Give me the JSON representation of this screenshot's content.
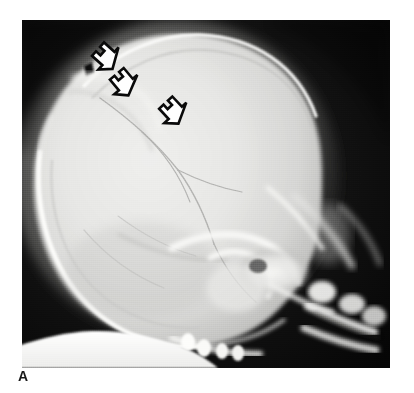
{
  "figure": {
    "label": "A",
    "modality": "radiograph",
    "view": "lateral skull",
    "background_color": "#ffffff"
  },
  "plate": {
    "x": 22,
    "y": 20,
    "width": 368,
    "height": 348,
    "film_background_color": "#0d0d0d",
    "corner_shadow_color": "#000000"
  },
  "anatomy": {
    "cranial_vault": {
      "name": "cranial-vault",
      "fill_color": "#e4e4e2",
      "description": "large lucent calvarium occupying left two-thirds of film"
    },
    "inner_table_line": {
      "name": "inner-table",
      "stroke_color": "#bdbdbb"
    },
    "outer_cortical_rim": {
      "name": "outer-cortical-rim",
      "stroke_color": "#fdfdfd",
      "description": "bright thin cortical line along vertex and occiput"
    },
    "scalp_soft_tissue": {
      "name": "scalp-soft-tissue",
      "fill_color": "#7a7a78"
    },
    "vascular_markings": {
      "name": "vascular-groove-markings",
      "stroke_color": "#9e9e9c",
      "count": 5
    },
    "lucent_band": {
      "name": "lucent-fracture-band",
      "stroke_color": "#f2f2f0",
      "description": "bright linear lucency under vertex indicated by arrows"
    },
    "vertex_notch": {
      "name": "vertex-cortical-notch",
      "fill_color": "#121212"
    },
    "skull_base": {
      "name": "skull-base",
      "fill_color": "#f6f6f4",
      "description": "petrous ridges, sella and sphenoid complex, mid right of film"
    },
    "facial_bones": {
      "name": "facial-bones",
      "fill_color": "#ededeb"
    },
    "cervical_spine": {
      "name": "cervical-spine",
      "fill_color": "#f4f4f2"
    },
    "mandible_teeth": {
      "name": "mandible-and-teeth",
      "fill_color": "#fafaf8"
    },
    "support_pad": {
      "name": "patient-support-pad",
      "fill_color": "#fcfcfa",
      "description": "bright irregular white band at inferior film margin"
    }
  },
  "arrows": {
    "style": "hollow-outline",
    "stroke_color": "#0a0a0a",
    "fill_color": "#ffffff",
    "direction": "up-left",
    "count": 3,
    "items": [
      {
        "name": "arrow-marker-1",
        "x": 94,
        "y": 48,
        "rotation": -138,
        "scale": 1.0
      },
      {
        "name": "arrow-marker-2",
        "x": 110,
        "y": 75,
        "rotation": -130,
        "scale": 1.0
      },
      {
        "name": "arrow-marker-3",
        "x": 160,
        "y": 103,
        "rotation": -133,
        "scale": 1.0
      }
    ]
  }
}
